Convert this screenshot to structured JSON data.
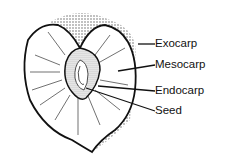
{
  "diagram": {
    "labels": [
      {
        "id": "exocarp",
        "text": "Exocarp",
        "x": 155,
        "y": 38
      },
      {
        "id": "mesocarp",
        "text": "Mesocarp",
        "x": 155,
        "y": 59
      },
      {
        "id": "endocarp",
        "text": "Endocarp",
        "x": 155,
        "y": 85
      },
      {
        "id": "seed",
        "text": "Seed",
        "x": 155,
        "y": 105
      }
    ]
  }
}
